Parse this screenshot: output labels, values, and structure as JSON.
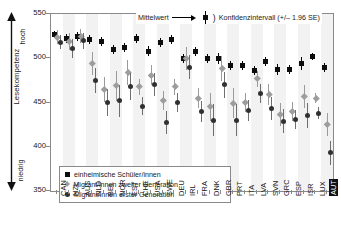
{
  "axis": {
    "y_title": "Lesekompetenz",
    "pole_high": "hoch",
    "pole_low": "niedrig",
    "y_ticks": [
      "550",
      "500",
      "450",
      "400",
      "350"
    ]
  },
  "legend_top": {
    "mean_label": "Mittelwert",
    "arrow_icon": "arrow-right-icon",
    "ci_label": "Konfidenzintervall (+/– 1.96 SE)",
    "paren": ")"
  },
  "legend_box": {
    "items": [
      {
        "marker": "square",
        "label": "einheimische Schüler/innen"
      },
      {
        "marker": "diamond",
        "label": "Migrant/innen zweiter Generation"
      },
      {
        "marker": "circle",
        "label": "Migrant/innen erster Generation"
      }
    ]
  },
  "chart_data": {
    "type": "scatter",
    "title": "",
    "xlabel": "",
    "ylabel": "Lesekompetenz",
    "ylim": [
      350,
      550
    ],
    "yticks": [
      350,
      400,
      450,
      500,
      550
    ],
    "grid": false,
    "legend_position": "top-right and inside-bottom-left",
    "highlighted_category": "AUT",
    "error_bars": "95% confidence interval (+/- 1.96 SE)",
    "categories": [
      "CAN",
      "NZL",
      "AUS",
      "NLD",
      "BEL",
      "NOR",
      "EST",
      "CHE",
      "USA",
      "SWE",
      "DEU",
      "IRL",
      "FRA",
      "DNK",
      "GBR",
      "PRT",
      "ITA",
      "LVA",
      "SVN",
      "GRC",
      "ESP",
      "ISR",
      "LUX",
      "AUT"
    ],
    "series": [
      {
        "name": "einheimische Schüler/innen",
        "marker": "square",
        "values": [
          527,
          522,
          525,
          521,
          519,
          510,
          512,
          522,
          508,
          518,
          521,
          500,
          508,
          500,
          500,
          492,
          492,
          486,
          496,
          487,
          487,
          494,
          502,
          490
        ],
        "ci_low": [
          523,
          517,
          520,
          516,
          514,
          505,
          507,
          517,
          502,
          513,
          516,
          495,
          503,
          495,
          494,
          487,
          487,
          481,
          491,
          481,
          482,
          487,
          498,
          485
        ],
        "ci_high": [
          531,
          527,
          530,
          526,
          524,
          515,
          517,
          527,
          514,
          523,
          526,
          505,
          513,
          505,
          506,
          497,
          497,
          491,
          501,
          493,
          492,
          501,
          506,
          495
        ]
      },
      {
        "name": "Migrant/innen zweiter Generation",
        "marker": "diamond",
        "values": [
          524,
          519,
          525,
          494,
          465,
          469,
          484,
          468,
          481,
          452,
          468,
          500,
          455,
          445,
          488,
          449,
          450,
          477,
          459,
          436,
          440,
          457,
          455,
          425
        ],
        "ci_low": [
          516,
          509,
          517,
          481,
          451,
          452,
          470,
          459,
          470,
          441,
          459,
          487,
          444,
          429,
          474,
          432,
          439,
          468,
          447,
          423,
          429,
          444,
          449,
          412
        ],
        "ci_high": [
          532,
          529,
          533,
          507,
          479,
          486,
          498,
          477,
          492,
          463,
          477,
          513,
          466,
          461,
          502,
          466,
          461,
          486,
          471,
          449,
          451,
          470,
          461,
          438
        ]
      },
      {
        "name": "Migrant/innen erster Generation",
        "marker": "circle",
        "values": [
          518,
          511,
          520,
          475,
          450,
          452,
          468,
          446,
          470,
          427,
          450,
          490,
          440,
          430,
          470,
          430,
          441,
          460,
          443,
          429,
          431,
          435,
          438,
          393
        ],
        "ci_low": [
          510,
          500,
          511,
          461,
          435,
          434,
          453,
          436,
          457,
          414,
          439,
          476,
          428,
          412,
          455,
          412,
          429,
          449,
          430,
          415,
          420,
          421,
          431,
          379
        ],
        "ci_high": [
          526,
          522,
          529,
          489,
          465,
          470,
          483,
          456,
          483,
          440,
          461,
          504,
          452,
          448,
          485,
          448,
          453,
          471,
          456,
          443,
          442,
          449,
          445,
          407
        ]
      }
    ]
  }
}
